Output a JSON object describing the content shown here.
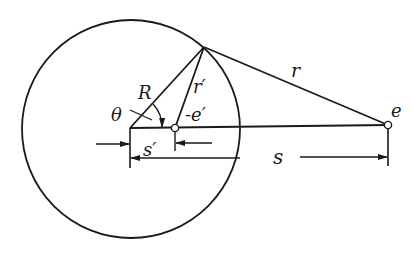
{
  "diagram": {
    "labels": {
      "R": "R",
      "theta": "θ",
      "r_prime": "r′",
      "minus_e_prime": "-e′",
      "r": "r",
      "e": "e",
      "s_prime": "s′",
      "s": "s"
    },
    "colors": {
      "stroke": "#1a1a1a",
      "background": "#ffffff"
    }
  }
}
